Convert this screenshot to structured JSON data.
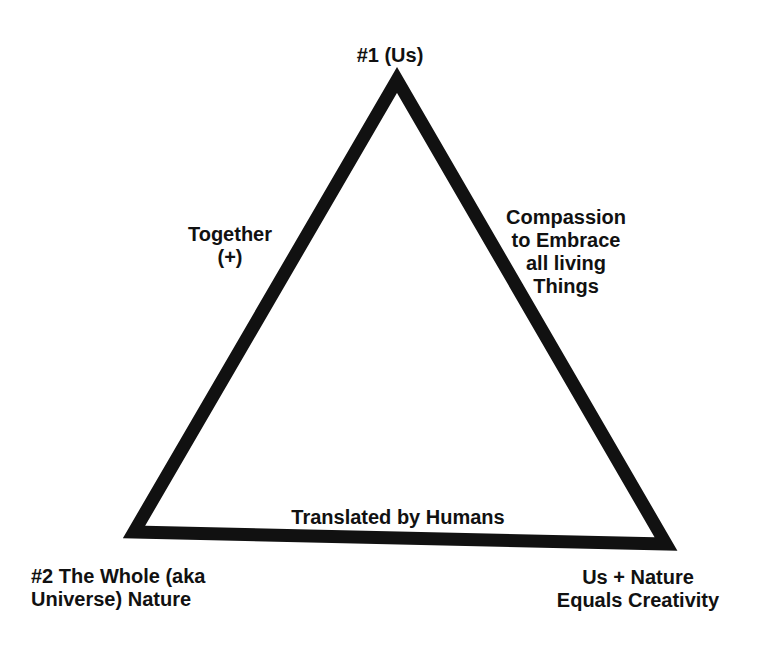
{
  "diagram": {
    "type": "triangle",
    "colors": {
      "background": "#ffffff",
      "stroke": "#111111",
      "text": "#111111"
    },
    "vertices": {
      "top": {
        "label_lines": [
          "#1 (Us)"
        ]
      },
      "bottom_left": {
        "label_lines": [
          "#2 The Whole (aka",
          "Universe) Nature"
        ]
      },
      "bottom_right": {
        "label_lines": [
          "Us + Nature",
          "Equals Creativity"
        ]
      }
    },
    "edges": {
      "left": {
        "label_lines": [
          "Together",
          "(+)"
        ]
      },
      "right": {
        "label_lines": [
          "Compassion",
          "to Embrace",
          "all living",
          "Things"
        ]
      },
      "bottom": {
        "label_lines": [
          "Translated by Humans"
        ]
      }
    }
  }
}
